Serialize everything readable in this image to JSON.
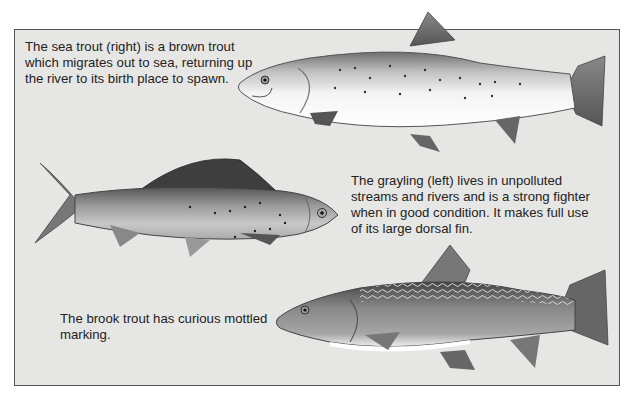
{
  "illustration": {
    "background_color": "#e6e6e4",
    "border_color": "#555555",
    "captions": {
      "sea_trout": "The sea trout (right) is a brown trout which migrates out to sea, returning up the river to its birth place to spawn.",
      "grayling": "The grayling (left) lives in unpolluted streams and rivers and is a strong fighter when in good condition. It makes full use of its large dorsal fin.",
      "brook_trout": "The brook trout has curious mottled marking."
    },
    "fish": [
      {
        "name": "sea trout",
        "facing": "left",
        "icon": "fish-sea-trout-illustration"
      },
      {
        "name": "grayling",
        "facing": "right",
        "icon": "fish-grayling-illustration"
      },
      {
        "name": "brook trout",
        "facing": "left",
        "icon": "fish-brook-trout-illustration"
      }
    ]
  }
}
